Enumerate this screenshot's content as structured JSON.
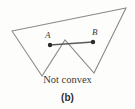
{
  "figure": {
    "caption": "Not convex",
    "tag": "(b)",
    "colors": {
      "background": "#fdfdfc",
      "polygon_stroke": "#8a8a8a",
      "segment_stroke": "#5a5a5a",
      "point_fill": "#2b2b2b",
      "text": "#3a3a3a"
    },
    "points": [
      {
        "id": "A",
        "label": "A",
        "x": 50,
        "y": 45
      },
      {
        "id": "B",
        "label": "B",
        "x": 93,
        "y": 42
      }
    ],
    "segment": {
      "name": "segment-AB",
      "from": "A",
      "to": "B",
      "x1": 50,
      "y1": 45,
      "x2": 93,
      "y2": 42
    },
    "polygon": {
      "name": "non-convex-polygon",
      "vertex_count": 5,
      "points_attr": "12,31 126,8 94,73 65,40 42,76",
      "vertices": [
        {
          "x": 12,
          "y": 31
        },
        {
          "x": 126,
          "y": 8
        },
        {
          "x": 94,
          "y": 73
        },
        {
          "x": 65,
          "y": 40
        },
        {
          "x": 42,
          "y": 76
        }
      ]
    }
  }
}
